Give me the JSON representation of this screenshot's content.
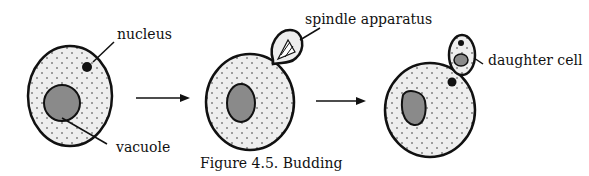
{
  "figure": {
    "caption": "Figure 4.5. Budding",
    "labels": {
      "nucleus": "nucleus",
      "vacuole": "vacuole",
      "spindle": "spindle apparatus",
      "daughter": "daughter cell"
    },
    "stages": [
      {
        "name": "parent cell",
        "parts": [
          "nucleus",
          "vacuole",
          "cytoplasm"
        ]
      },
      {
        "name": "bud forming",
        "parts": [
          "spindle apparatus",
          "vacuole",
          "cytoplasm"
        ]
      },
      {
        "name": "daughter cell formed",
        "parts": [
          "daughter cell",
          "nucleus",
          "vacuole",
          "cytoplasm"
        ]
      }
    ],
    "colors": {
      "outline": "#111111",
      "cytoplasm": "#eeeeee",
      "vacuole": "#8a8a8a",
      "nucleus": "#111111",
      "background": "#ffffff"
    }
  }
}
